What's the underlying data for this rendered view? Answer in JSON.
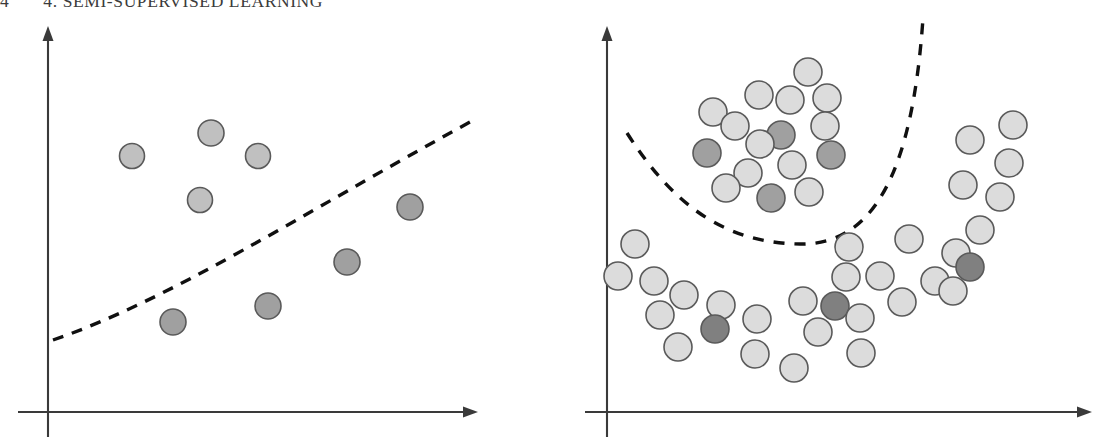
{
  "running_head": {
    "folio": "4",
    "title": "4. SEMI-SUPERVISED LEARNING"
  },
  "colors": {
    "axis": "#3a3a3a",
    "boundary": "#101010",
    "circle_stroke": "#5a5a5a",
    "unlabeled_fill": "#dcdcdc",
    "labeled_light_fill": "#c0c0c0",
    "labeled_dark_fill": "#a0a0a0",
    "labeled_darkest_fill": "#808080",
    "page_background": "#ffffff"
  },
  "figure": {
    "caption": "",
    "panels": [
      {
        "name": "left-panel",
        "label": "sparse labeled data with linear decision boundary",
        "axes": {
          "x_axis": {
            "x1": 18,
            "y1": 412,
            "x2": 478,
            "y2": 412,
            "arrow": "right"
          },
          "y_axis": {
            "x1": 48,
            "y1": 437,
            "x2": 48,
            "y2": 26,
            "arrow": "up"
          }
        },
        "boundary": {
          "type": "dashed-curve",
          "dash": "11 9",
          "width": 3.4,
          "path": "M 53 340 C 170 300, 300 215, 470 122"
        },
        "points": [
          {
            "cx": 132,
            "cy": 156,
            "r": 12.5,
            "class": "labeled-light"
          },
          {
            "cx": 211,
            "cy": 133,
            "r": 13,
            "class": "labeled-light"
          },
          {
            "cx": 258,
            "cy": 156,
            "r": 12.5,
            "class": "labeled-light"
          },
          {
            "cx": 200,
            "cy": 200,
            "r": 12.5,
            "class": "labeled-light"
          },
          {
            "cx": 410,
            "cy": 207,
            "r": 13,
            "class": "labeled-dark"
          },
          {
            "cx": 347,
            "cy": 262,
            "r": 13,
            "class": "labeled-dark"
          },
          {
            "cx": 268,
            "cy": 306,
            "r": 13,
            "class": "labeled-dark"
          },
          {
            "cx": 173,
            "cy": 322,
            "r": 13,
            "class": "labeled-dark"
          }
        ]
      },
      {
        "name": "right-panel",
        "label": "dense unlabeled data with curved decision boundary",
        "axes": {
          "x_axis": {
            "x1": 25,
            "y1": 412,
            "x2": 532,
            "y2": 412,
            "arrow": "right"
          },
          "y_axis": {
            "x1": 47,
            "y1": 437,
            "x2": 47,
            "y2": 26,
            "arrow": "up"
          }
        },
        "boundary": {
          "type": "dashed-curve",
          "dash": "11 10",
          "width": 3.4,
          "path": "M 67 133 C 110 200, 160 243, 240 244 C 310 245, 352 180, 363 18"
        },
        "points": [
          {
            "cx": 248,
            "cy": 72,
            "r": 14,
            "class": "unlabeled"
          },
          {
            "cx": 199,
            "cy": 95,
            "r": 14,
            "class": "unlabeled"
          },
          {
            "cx": 230,
            "cy": 100,
            "r": 14,
            "class": "unlabeled"
          },
          {
            "cx": 267,
            "cy": 98,
            "r": 14,
            "class": "unlabeled"
          },
          {
            "cx": 153,
            "cy": 112,
            "r": 14,
            "class": "unlabeled"
          },
          {
            "cx": 175,
            "cy": 126,
            "r": 14,
            "class": "unlabeled"
          },
          {
            "cx": 265,
            "cy": 126,
            "r": 14,
            "class": "unlabeled"
          },
          {
            "cx": 221,
            "cy": 135,
            "r": 14,
            "class": "labeled-dark"
          },
          {
            "cx": 200,
            "cy": 144,
            "r": 14,
            "class": "unlabeled"
          },
          {
            "cx": 147,
            "cy": 153,
            "r": 14,
            "class": "labeled-dark"
          },
          {
            "cx": 271,
            "cy": 155,
            "r": 14,
            "class": "labeled-dark"
          },
          {
            "cx": 232,
            "cy": 165,
            "r": 14,
            "class": "unlabeled"
          },
          {
            "cx": 188,
            "cy": 173,
            "r": 14,
            "class": "unlabeled"
          },
          {
            "cx": 166,
            "cy": 188,
            "r": 14,
            "class": "unlabeled"
          },
          {
            "cx": 211,
            "cy": 198,
            "r": 14,
            "class": "labeled-dark"
          },
          {
            "cx": 249,
            "cy": 192,
            "r": 14,
            "class": "unlabeled"
          },
          {
            "cx": 75,
            "cy": 244,
            "r": 14,
            "class": "unlabeled"
          },
          {
            "cx": 58,
            "cy": 276,
            "r": 14,
            "class": "unlabeled"
          },
          {
            "cx": 94,
            "cy": 281,
            "r": 14,
            "class": "unlabeled"
          },
          {
            "cx": 124,
            "cy": 295,
            "r": 14,
            "class": "unlabeled"
          },
          {
            "cx": 100,
            "cy": 315,
            "r": 14,
            "class": "unlabeled"
          },
          {
            "cx": 161,
            "cy": 305,
            "r": 14,
            "class": "unlabeled"
          },
          {
            "cx": 118,
            "cy": 347,
            "r": 14,
            "class": "unlabeled"
          },
          {
            "cx": 155,
            "cy": 329,
            "r": 14,
            "class": "labeled-darkest"
          },
          {
            "cx": 197,
            "cy": 319,
            "r": 14,
            "class": "unlabeled"
          },
          {
            "cx": 195,
            "cy": 354,
            "r": 14,
            "class": "unlabeled"
          },
          {
            "cx": 234,
            "cy": 368,
            "r": 14,
            "class": "unlabeled"
          },
          {
            "cx": 243,
            "cy": 301,
            "r": 14,
            "class": "unlabeled"
          },
          {
            "cx": 258,
            "cy": 332,
            "r": 14,
            "class": "unlabeled"
          },
          {
            "cx": 286,
            "cy": 277,
            "r": 14,
            "class": "unlabeled"
          },
          {
            "cx": 275,
            "cy": 306,
            "r": 14,
            "class": "labeled-darkest"
          },
          {
            "cx": 300,
            "cy": 318,
            "r": 14,
            "class": "unlabeled"
          },
          {
            "cx": 301,
            "cy": 353,
            "r": 14,
            "class": "unlabeled"
          },
          {
            "cx": 289,
            "cy": 247,
            "r": 14,
            "class": "unlabeled"
          },
          {
            "cx": 320,
            "cy": 276,
            "r": 14,
            "class": "unlabeled"
          },
          {
            "cx": 342,
            "cy": 302,
            "r": 14,
            "class": "unlabeled"
          },
          {
            "cx": 349,
            "cy": 239,
            "r": 14,
            "class": "unlabeled"
          },
          {
            "cx": 396,
            "cy": 253,
            "r": 14,
            "class": "unlabeled"
          },
          {
            "cx": 375,
            "cy": 281,
            "r": 14,
            "class": "unlabeled"
          },
          {
            "cx": 393,
            "cy": 291,
            "r": 14,
            "class": "unlabeled"
          },
          {
            "cx": 410,
            "cy": 267,
            "r": 14,
            "class": "labeled-darkest"
          },
          {
            "cx": 420,
            "cy": 230,
            "r": 14,
            "class": "unlabeled"
          },
          {
            "cx": 440,
            "cy": 197,
            "r": 14,
            "class": "unlabeled"
          },
          {
            "cx": 403,
            "cy": 185,
            "r": 14,
            "class": "unlabeled"
          },
          {
            "cx": 449,
            "cy": 163,
            "r": 14,
            "class": "unlabeled"
          },
          {
            "cx": 410,
            "cy": 140,
            "r": 14,
            "class": "unlabeled"
          },
          {
            "cx": 453,
            "cy": 125,
            "r": 14,
            "class": "unlabeled"
          }
        ]
      }
    ]
  }
}
